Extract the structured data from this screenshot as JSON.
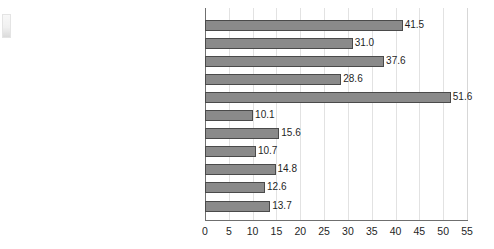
{
  "chart_data": {
    "type": "bar",
    "orientation": "horizontal",
    "title": "",
    "subtitle": "",
    "xlabel": "",
    "ylabel": "",
    "xlim": [
      0,
      55
    ],
    "xticks": [
      0,
      5,
      10,
      15,
      20,
      25,
      30,
      35,
      40,
      45,
      50,
      55
    ],
    "grid": "vertical",
    "legend": "none",
    "bar_color": "#8a8a8a",
    "bar_border_color": "#4a4a4a",
    "gridline_color": "#e2e2e2",
    "axis_color": "#6f6f6f",
    "categories": [
      "65+ females",
      "65+ males",
      "Unattached female",
      "Unattached male",
      "Under 18 in female lone-parent families",
      "Under 18 in two-parent families",
      "Persons under 18 years of age",
      "Persons in economic families",
      "All females",
      "All males",
      "All persons"
    ],
    "values": [
      41.5,
      31.0,
      37.6,
      28.6,
      51.6,
      10.1,
      15.6,
      10.7,
      14.8,
      12.6,
      13.7
    ],
    "value_labels": [
      "41.5",
      "31.0",
      "37.6",
      "28.6",
      "51.6",
      "10.1",
      "15.6",
      "10.7",
      "14.8",
      "12.6",
      "13.7"
    ],
    "xtick_labels": [
      "0",
      "5",
      "10",
      "15",
      "20",
      "25",
      "30",
      "35",
      "40",
      "45",
      "50",
      "55"
    ]
  }
}
